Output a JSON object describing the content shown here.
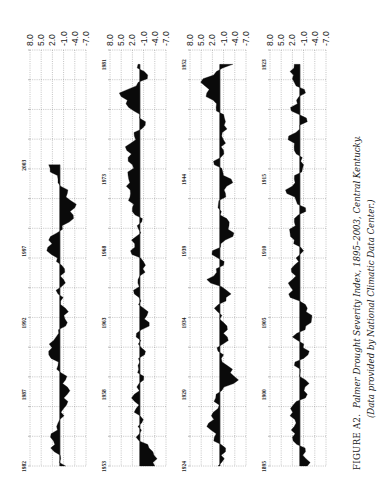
{
  "chart_data": {
    "type": "area",
    "title": "FIGURE A2. Palmer Drought Severity Index, 1895–2003, Central Kentucky.",
    "subtitle": "(Data provided by National Climatic Data Center.)",
    "orientation": "rotated 90° clockwise; time runs bottom→top within each strip; value axis horizontal with 8.0 at left and -7.0 at right",
    "xlabel": "Year",
    "ylabel": "PDSI",
    "value_ticks": [
      "8.0",
      "5.0",
      "2.0",
      "-1.0",
      "-4.0",
      "-7.0"
    ],
    "value_range": [
      8.0,
      -7.0
    ],
    "grid": true,
    "legend": null,
    "panels": [
      {
        "name": "1982-2003",
        "start": 1982,
        "end": 2010,
        "year_labels": [
          "1982",
          "1987",
          "1992",
          "1997",
          "2003"
        ],
        "years": [
          1982,
          1983,
          1984,
          1985,
          1986,
          1987,
          1988,
          1989,
          1990,
          1991,
          1992,
          1993,
          1994,
          1995,
          1996,
          1997,
          1998,
          1999,
          2000,
          2001,
          2002,
          2003
        ],
        "values": [
          -1.5,
          1.5,
          2.5,
          0.5,
          -1.0,
          -2.0,
          -1.5,
          0.5,
          3.0,
          1.0,
          -2.0,
          -1.5,
          0.5,
          -1.0,
          -0.5,
          3.5,
          2.5,
          -2.5,
          -4.0,
          -2.0,
          0.5,
          3.0
        ]
      },
      {
        "name": "1953-1981",
        "start": 1953,
        "end": 1981,
        "year_labels": [
          "1953",
          "1958",
          "1963",
          "1968",
          "1973",
          "1981"
        ],
        "years": [
          1953,
          1954,
          1955,
          1956,
          1957,
          1958,
          1959,
          1960,
          1961,
          1962,
          1963,
          1964,
          1965,
          1966,
          1967,
          1968,
          1969,
          1970,
          1971,
          1972,
          1973,
          1974,
          1975,
          1976,
          1977,
          1978,
          1979,
          1980,
          1981
        ],
        "values": [
          -4.0,
          -3.5,
          1.0,
          -0.5,
          1.0,
          1.5,
          -1.0,
          0.5,
          -1.5,
          1.0,
          -2.5,
          -1.0,
          1.5,
          0.5,
          -1.5,
          2.5,
          1.0,
          -0.5,
          2.0,
          2.5,
          3.0,
          2.0,
          3.5,
          1.5,
          -1.5,
          3.0,
          5.5,
          -2.0,
          0.5
        ]
      },
      {
        "name": "1924-1952",
        "start": 1924,
        "end": 1952,
        "year_labels": [
          "1924",
          "1929",
          "1934",
          "1939",
          "1944",
          "1952"
        ],
        "years": [
          1924,
          1925,
          1926,
          1927,
          1928,
          1929,
          1930,
          1931,
          1932,
          1933,
          1934,
          1935,
          1936,
          1937,
          1938,
          1939,
          1940,
          1941,
          1942,
          1943,
          1944,
          1945,
          1946,
          1947,
          1948,
          1949,
          1950,
          1951,
          1952
        ],
        "values": [
          0.5,
          -1.5,
          1.5,
          3.0,
          0.5,
          1.0,
          -5.0,
          -2.0,
          0.5,
          -2.0,
          -1.0,
          1.5,
          -3.0,
          3.5,
          -1.0,
          2.0,
          -3.5,
          -2.5,
          0.5,
          -1.5,
          -3.0,
          1.5,
          -1.0,
          -0.5,
          -1.5,
          1.0,
          3.5,
          4.5,
          -3.5
        ]
      },
      {
        "name": "1895-1923",
        "start": 1895,
        "end": 1923,
        "year_labels": [
          "1895",
          "1900",
          "1905",
          "1910",
          "1915",
          "1923"
        ],
        "years": [
          1895,
          1896,
          1897,
          1898,
          1899,
          1900,
          1901,
          1902,
          1903,
          1904,
          1905,
          1906,
          1907,
          1908,
          1909,
          1910,
          1911,
          1912,
          1913,
          1914,
          1915,
          1916,
          1917,
          1918,
          1919,
          1920,
          1921,
          1922,
          1923
        ],
        "values": [
          -2.0,
          -1.5,
          2.0,
          1.0,
          2.5,
          -2.0,
          -1.5,
          1.5,
          -2.5,
          2.0,
          -3.0,
          -2.0,
          3.0,
          2.0,
          1.5,
          -1.0,
          2.5,
          1.5,
          -1.5,
          3.5,
          1.5,
          -1.0,
          1.5,
          3.0,
          -2.0,
          2.5,
          -1.5,
          2.0,
          1.5
        ]
      }
    ]
  },
  "figure": {
    "caption_label": "FIGURE A2.",
    "caption_title": "Palmer Drought Severity Index, 1895–2003, Central Kentucky.",
    "caption_source": "(Data provided by National Climatic Data Center.)"
  }
}
